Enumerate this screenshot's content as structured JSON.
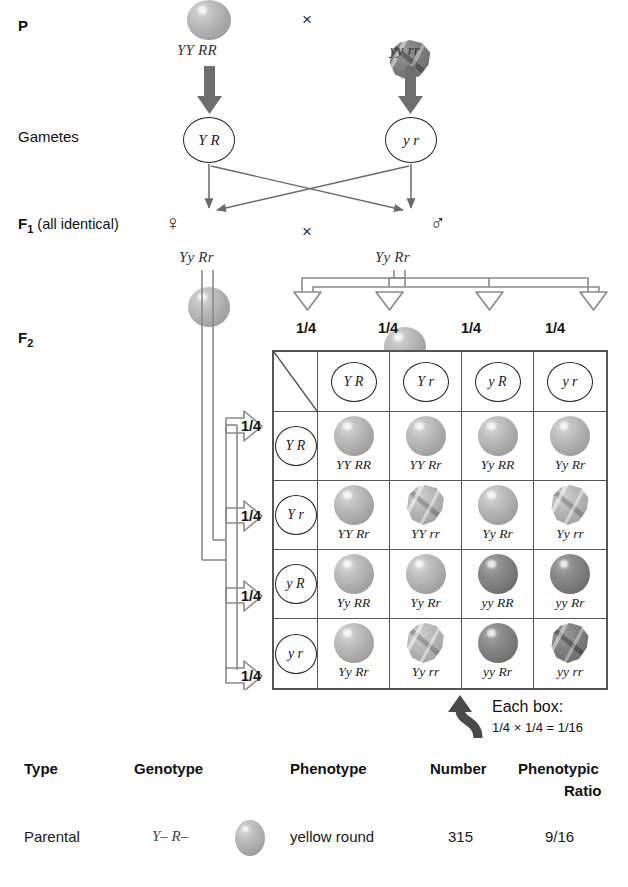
{
  "rows": {
    "p_label": "P",
    "gametes_label": "Gametes",
    "f1_label_bold": "F",
    "f1_label_sub": "1",
    "f1_label_rest": " (all identical)",
    "f2_label_bold": "F",
    "f2_label_sub": "2"
  },
  "symbols": {
    "cross": "×",
    "female": "♀",
    "male": "♂"
  },
  "parents": {
    "left": {
      "genotype": "YY RR",
      "seed": "round-yellow"
    },
    "right": {
      "genotype": "yy rr",
      "seed": "wrinkled-green"
    }
  },
  "gametes": {
    "left": "Y R",
    "right": "y r"
  },
  "f1": {
    "left": {
      "genotype": "Yy Rr",
      "seed": "round-yellow",
      "sex": "♀"
    },
    "right": {
      "genotype": "Yy Rr",
      "seed": "round-yellow",
      "sex": "♂"
    }
  },
  "punnett": {
    "col_fractions": [
      "1/4",
      "1/4",
      "1/4",
      "1/4"
    ],
    "row_fractions": [
      "1/4",
      "1/4",
      "1/4",
      "1/4"
    ],
    "col_headers": [
      "Y R",
      "Y r",
      "y R",
      "y r"
    ],
    "row_headers": [
      "Y R",
      "Y r",
      "y R",
      "y r"
    ],
    "cells": [
      [
        {
          "genotype": "YY RR",
          "seed": "round-yellow"
        },
        {
          "genotype": "YY Rr",
          "seed": "round-yellow"
        },
        {
          "genotype": "Yy RR",
          "seed": "round-yellow"
        },
        {
          "genotype": "Yy Rr",
          "seed": "round-yellow"
        }
      ],
      [
        {
          "genotype": "YY Rr",
          "seed": "round-yellow"
        },
        {
          "genotype": "YY rr",
          "seed": "wrinkled-yellow"
        },
        {
          "genotype": "Yy Rr",
          "seed": "round-yellow"
        },
        {
          "genotype": "Yy rr",
          "seed": "wrinkled-yellow"
        }
      ],
      [
        {
          "genotype": "Yy RR",
          "seed": "round-yellow"
        },
        {
          "genotype": "Yy Rr",
          "seed": "round-yellow"
        },
        {
          "genotype": "yy RR",
          "seed": "round-green"
        },
        {
          "genotype": "yy Rr",
          "seed": "round-green"
        }
      ],
      [
        {
          "genotype": "Yy Rr",
          "seed": "round-yellow"
        },
        {
          "genotype": "Yy rr",
          "seed": "wrinkled-yellow"
        },
        {
          "genotype": "yy Rr",
          "seed": "round-green"
        },
        {
          "genotype": "yy rr",
          "seed": "wrinkled-green"
        }
      ]
    ]
  },
  "each_box": {
    "line1": "Each box:",
    "line2": "1/4 × 1/4 = 1/16"
  },
  "bottom_table": {
    "headers": [
      "Type",
      "Genotype",
      "Phenotype",
      "Number",
      "Phenotypic",
      "Ratio"
    ],
    "rows": [
      {
        "type": "Parental",
        "genotype": "Y– R–",
        "seed": "round-yellow",
        "phenotype": "yellow round",
        "number": "315",
        "ratio": "9/16"
      }
    ]
  },
  "colors": {
    "grid_line": "#555555",
    "text": "#1a1a1a",
    "arrow_solid": "#6e6e6e",
    "arrow_outline": "#8a8a8a",
    "seed_yellow": "#bdbdbd",
    "seed_green": "#7c7c7c"
  }
}
